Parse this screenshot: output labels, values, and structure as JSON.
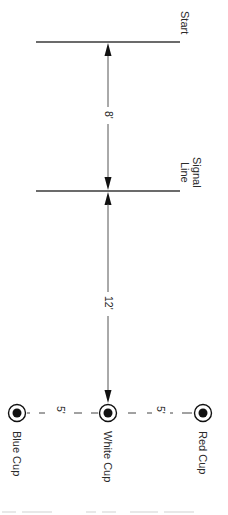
{
  "diagram": {
    "type": "field-layout",
    "lines": [
      {
        "id": "start",
        "label": "Start"
      },
      {
        "id": "signal",
        "label_line1": "Signal",
        "label_line2": "Line"
      }
    ],
    "distances": {
      "start_to_signal": "8'",
      "signal_to_white_cup": "12'",
      "white_to_blue": "5'",
      "white_to_red": "5'"
    },
    "cups": [
      {
        "id": "blue",
        "label": "Blue Cup"
      },
      {
        "id": "white",
        "label": "White Cup"
      },
      {
        "id": "red",
        "label": "Red Cup"
      }
    ],
    "colors": {
      "line": "#3a3a3a",
      "arrow": "#111111",
      "cup_fill": "#111111"
    }
  }
}
